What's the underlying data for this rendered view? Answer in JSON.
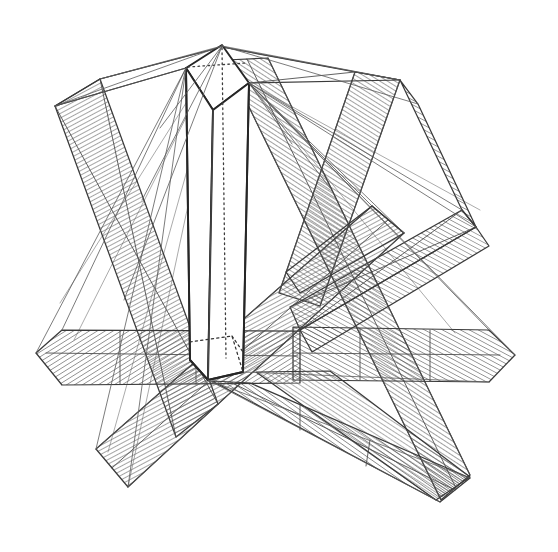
{
  "figure": {
    "medium": "ink line drawing",
    "canvas": {
      "width": 558,
      "height": 552,
      "background": "#ffffff"
    },
    "ink": {
      "outline_color": "#3a3a3a",
      "heavy_outline_color": "#262626",
      "hatch_color": "#555555",
      "ray_color": "#5a5a5a",
      "hidden_edge_color": "#333333"
    },
    "hatching": {
      "style": "fine parallel ruled lines",
      "spacing_px": 4,
      "stroke_width_px": 1.1,
      "angles_deg": [
        45,
        -45,
        60,
        -60,
        75,
        -75
      ]
    }
  },
  "prism": {
    "name": "central vertical triangular prism",
    "apex": [
      222,
      45
    ],
    "top_left_corner": [
      186,
      68
    ],
    "top_right_corner": [
      249,
      83
    ],
    "top_front_corner": [
      213,
      110
    ],
    "base_left": [
      190,
      360
    ],
    "base_right": [
      243,
      372
    ],
    "base_front": [
      208,
      380
    ],
    "axis": {
      "from": [
        222,
        48
      ],
      "to": [
        226,
        358
      ],
      "style": "dotted"
    },
    "hidden_edges": "dotted lower rear silhouette"
  },
  "bands": [
    {
      "id": "band-upper-left",
      "label": "upper-left descending ribbon",
      "hatch_angle": 62,
      "tone": "#5a5a5a"
    },
    {
      "id": "band-upper-right",
      "label": "upper-right descending ribbon",
      "hatch_angle": -58,
      "tone": "#4f4f4f"
    },
    {
      "id": "band-right-upper-wedge",
      "label": "right upper folded wedge",
      "hatch_angle": -60,
      "tone": "#565656"
    },
    {
      "id": "band-right-horizontal",
      "label": "right horizontal ribbon",
      "hatch_angle": -62,
      "tone": "#585858"
    },
    {
      "id": "band-left-horizontal",
      "label": "left horizontal ribbon",
      "hatch_angle": 58,
      "tone": "#575757"
    },
    {
      "id": "band-lower-left",
      "label": "lower-left descending ribbon",
      "hatch_angle": 60,
      "tone": "#545454"
    },
    {
      "id": "band-lower-right",
      "label": "lower-right descending ribbon",
      "hatch_angle": -55,
      "tone": "#4d4d4d"
    },
    {
      "id": "band-center-diagonal",
      "label": "central long diagonal ribbon",
      "hatch_angle": -57,
      "tone": "#515151"
    }
  ],
  "construction_lines": {
    "label": "thin projection rays from prism apex and corners",
    "count": 22,
    "origin_points": [
      "apex",
      "top_left_corner",
      "top_right_corner"
    ]
  }
}
